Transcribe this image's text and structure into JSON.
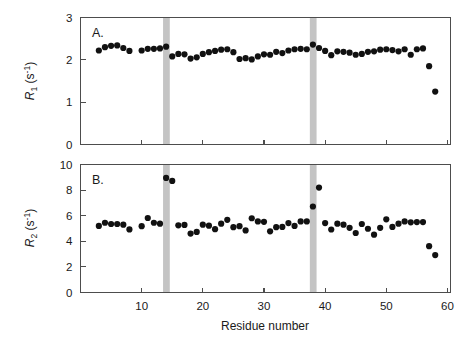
{
  "figure": {
    "background_color": "#ffffff",
    "marker_color": "#111111",
    "band_color": "#c4c4c4",
    "axis_color": "#4d4d4d",
    "xlabel": "Residue number",
    "xticks": [
      "10",
      "20",
      "30",
      "40",
      "50",
      "60"
    ]
  },
  "panels": {
    "a": {
      "letter": "A.",
      "ylabel_main": "R",
      "ylabel_sub": "1",
      "ylabel_units": " (s",
      "ylabel_sup": "-1",
      "ylabel_close": ")",
      "yticks": [
        "0",
        "1",
        "2",
        "3"
      ]
    },
    "b": {
      "letter": "B.",
      "ylabel_main": "R",
      "ylabel_sub": "2",
      "ylabel_units": " (s",
      "ylabel_sup": "-1",
      "ylabel_close": ")",
      "yticks": [
        "0",
        "2",
        "4",
        "6",
        "8",
        "10"
      ]
    }
  },
  "chart_data": [
    {
      "type": "scatter",
      "panel": "A",
      "title": "",
      "xlabel": "Residue number",
      "ylabel": "R1 (s^-1)",
      "xlim": [
        1,
        60
      ],
      "ylim": [
        0,
        3
      ],
      "xticks": [
        10,
        20,
        30,
        40,
        50,
        60
      ],
      "yticks": [
        0,
        1,
        2,
        3
      ],
      "grid": false,
      "legend": "none",
      "annotations": [
        {
          "type": "vertical-band",
          "x_start": 13.5,
          "x_end": 14.6,
          "color": "#c4c4c4"
        },
        {
          "type": "vertical-band",
          "x_start": 37.5,
          "x_end": 38.6,
          "color": "#c4c4c4"
        }
      ],
      "x": [
        3,
        4,
        5,
        6,
        7,
        8,
        10,
        11,
        12,
        13,
        14,
        15,
        16,
        17,
        18,
        19,
        20,
        21,
        22,
        23,
        24,
        25,
        26,
        27,
        28,
        29,
        30,
        31,
        32,
        33,
        34,
        35,
        36,
        37,
        38,
        39,
        40,
        41,
        42,
        43,
        44,
        45,
        46,
        47,
        48,
        49,
        50,
        51,
        52,
        53,
        54,
        55,
        56,
        57,
        58
      ],
      "y": [
        2.22,
        2.3,
        2.33,
        2.34,
        2.28,
        2.21,
        2.22,
        2.26,
        2.26,
        2.27,
        2.31,
        2.08,
        2.14,
        2.13,
        2.03,
        2.06,
        2.14,
        2.18,
        2.21,
        2.24,
        2.25,
        2.18,
        2.02,
        2.04,
        2.01,
        2.08,
        2.13,
        2.12,
        2.19,
        2.16,
        2.22,
        2.25,
        2.26,
        2.25,
        2.36,
        2.28,
        2.21,
        2.11,
        2.2,
        2.19,
        2.17,
        2.12,
        2.14,
        2.19,
        2.2,
        2.24,
        2.25,
        2.23,
        2.2,
        2.25,
        2.12,
        2.25,
        2.27,
        1.85,
        1.25
      ]
    },
    {
      "type": "scatter",
      "panel": "B",
      "title": "",
      "xlabel": "Residue number",
      "ylabel": "R2 (s^-1)",
      "xlim": [
        1,
        60
      ],
      "ylim": [
        0,
        10
      ],
      "xticks": [
        10,
        20,
        30,
        40,
        50,
        60
      ],
      "yticks": [
        0,
        2,
        4,
        6,
        8,
        10
      ],
      "grid": false,
      "legend": "none",
      "annotations": [
        {
          "type": "vertical-band",
          "x_start": 13.5,
          "x_end": 14.6,
          "color": "#c4c4c4"
        },
        {
          "type": "vertical-band",
          "x_start": 37.5,
          "x_end": 38.6,
          "color": "#c4c4c4"
        }
      ],
      "x": [
        3,
        4,
        5,
        6,
        7,
        8,
        10,
        11,
        12,
        13,
        14,
        15,
        16,
        17,
        18,
        19,
        20,
        21,
        22,
        23,
        24,
        25,
        26,
        27,
        28,
        29,
        30,
        31,
        32,
        33,
        34,
        35,
        36,
        37,
        38,
        39,
        40,
        41,
        42,
        43,
        44,
        45,
        46,
        47,
        48,
        49,
        50,
        51,
        52,
        53,
        54,
        55,
        56,
        57,
        58
      ],
      "y": [
        5.2,
        5.45,
        5.35,
        5.35,
        5.3,
        4.93,
        5.18,
        5.82,
        5.45,
        5.38,
        8.95,
        8.72,
        5.25,
        5.28,
        4.6,
        4.73,
        5.3,
        5.22,
        4.95,
        5.38,
        5.68,
        5.1,
        5.18,
        4.85,
        5.8,
        5.55,
        5.52,
        4.78,
        5.1,
        5.12,
        5.42,
        5.2,
        5.55,
        5.55,
        6.72,
        8.2,
        5.42,
        4.92,
        5.38,
        5.3,
        5.05,
        4.65,
        5.35,
        4.98,
        4.52,
        5.05,
        5.72,
        5.12,
        5.38,
        5.55,
        5.48,
        5.5,
        5.5,
        3.62,
        2.92
      ]
    }
  ]
}
